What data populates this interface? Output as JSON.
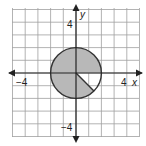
{
  "figure": {
    "type": "coordinate-plane-circle-sector",
    "grid": {
      "xmin": -5,
      "xmax": 5,
      "ymin": -5,
      "ymax": 5,
      "step": 1
    },
    "axes": {
      "x_label": "x",
      "y_label": "y",
      "x_tick_pos_label": "4",
      "x_tick_neg_label": "−4",
      "y_tick_pos_label": "4",
      "y_tick_neg_label": "−4"
    },
    "circle": {
      "center": [
        0,
        0
      ],
      "radius": 2,
      "fill": "#b8b8b8",
      "stroke": "#333333",
      "unshaded_sector": {
        "from_deg": -45,
        "to_deg": 0
      }
    },
    "colors": {
      "grid": "#9a9a9a",
      "axis": "#222222"
    }
  }
}
